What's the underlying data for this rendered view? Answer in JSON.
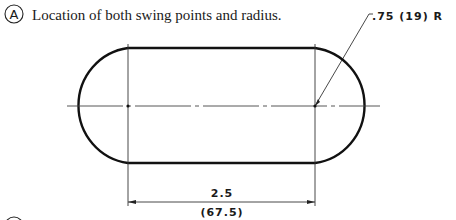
{
  "section_a": {
    "marker": "A",
    "caption": "Location of both swing points and radius."
  },
  "section_b": {
    "marker": "B",
    "caption": "Draw lines that connect the arcs."
  },
  "drawing": {
    "shape": "slot (obround)",
    "radius_callout": ".75 (19) R",
    "center_distance_in": "2.5",
    "center_distance_mm": "(67.5)",
    "colors": {
      "outline": "#111111",
      "thin": "#333333",
      "background": "#ffffff"
    }
  }
}
